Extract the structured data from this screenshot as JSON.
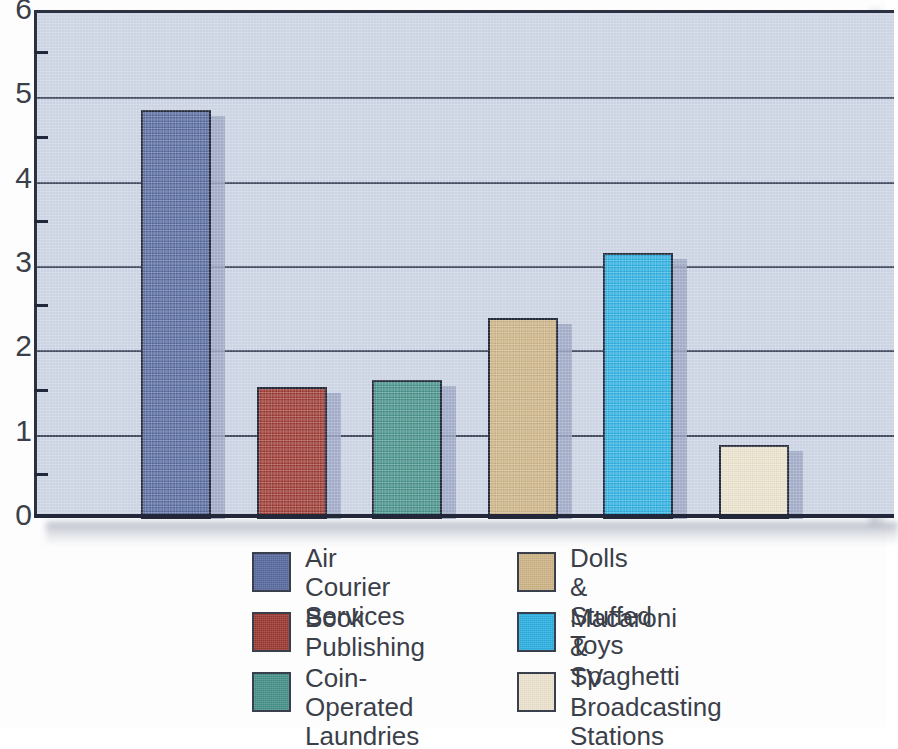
{
  "chart_data": {
    "type": "bar",
    "title": "",
    "subtitle": "",
    "xlabel": "",
    "ylabel": "",
    "ylim": [
      0,
      6
    ],
    "yticks": [
      "0",
      "1",
      "2",
      "3",
      "4",
      "5",
      "6"
    ],
    "minor_ticks": [
      0.5,
      1.5,
      2.5,
      3.5,
      4.5,
      5.5
    ],
    "grid": true,
    "grid_axis": "y",
    "legend_position": "bottom",
    "categories": [
      "Air Courier Services",
      "Book Publishing",
      "Coin-Operated Laundries",
      "Dolls & Stuffed Toys",
      "Macaroni & Spaghetti",
      "TV Broadcasting Stations"
    ],
    "values": [
      4.85,
      1.57,
      1.65,
      2.38,
      3.15,
      0.88
    ],
    "colors": [
      "#56699f",
      "#9b3730",
      "#45908a",
      "#cdb485",
      "#2aafe2",
      "#ece3cc"
    ]
  },
  "axis": {
    "y_labels": [
      "6",
      "5",
      "4",
      "3",
      "2",
      "1",
      "0"
    ]
  },
  "bars": [
    {
      "name": "Air Courier Services",
      "value": 4.85,
      "color": "#56699f",
      "side": "#9aa5c2"
    },
    {
      "name": "Book Publishing",
      "value": 1.57,
      "color": "#9b3730",
      "side": "#9aa5c2"
    },
    {
      "name": "Coin-Operated Laundries",
      "value": 1.65,
      "color": "#45908a",
      "side": "#9aa5c2"
    },
    {
      "name": "Dolls & Stuffed Toys",
      "value": 2.38,
      "color": "#cdb485",
      "side": "#9aa5c2"
    },
    {
      "name": "Macaroni & Spaghetti",
      "value": 3.15,
      "color": "#2aafe2",
      "side": "#9aa5c2"
    },
    {
      "name": "TV Broadcasting Stations",
      "value": 0.88,
      "color": "#ece3cc",
      "side": "#9aa5c2"
    }
  ],
  "legend": {
    "left_column": [
      {
        "label": "Air Courier\nServices",
        "color": "#56699f"
      },
      {
        "label": "Book\nPublishing",
        "color": "#9b3730"
      },
      {
        "label": "Coin-Operated\nLaundries",
        "color": "#45908a"
      }
    ],
    "right_column": [
      {
        "label": "Dolls &\nStuffed Toys",
        "color": "#cdb485"
      },
      {
        "label": "Macaroni &\nSpaghetti",
        "color": "#2aafe2"
      },
      {
        "label": "TV Broadcasting\nStations",
        "color": "#ece3cc"
      }
    ]
  },
  "theme": {
    "plot_background": "#ccd4e3",
    "axis_color": "#22273a",
    "grid_color": "#3a4055",
    "text_color": "#3b3f4a",
    "page_background": "#fdfdfd"
  }
}
